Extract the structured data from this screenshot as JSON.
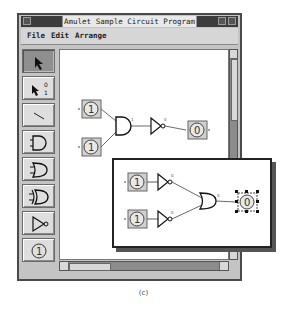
{
  "window": {
    "title": "Amulet Sample Circuit Program",
    "menu": [
      {
        "label": "File"
      },
      {
        "label": "Edit"
      },
      {
        "label": "Arrange"
      }
    ]
  },
  "palette": {
    "tools": [
      {
        "name": "select-tool",
        "selected": true
      },
      {
        "name": "toggle-value-tool",
        "label_top": "0",
        "label_bottom": "1",
        "selected": false
      },
      {
        "name": "wire-tool",
        "selected": false
      },
      {
        "name": "and-gate-tool",
        "selected": false
      },
      {
        "name": "or-gate-tool",
        "selected": false
      },
      {
        "name": "xor-gate-tool",
        "selected": false
      },
      {
        "name": "not-gate-tool",
        "selected": false
      },
      {
        "name": "input-switch-tool",
        "label": "1",
        "selected": false
      }
    ]
  },
  "canvas": {
    "inputs": [
      {
        "value": "1"
      },
      {
        "value": "1"
      }
    ],
    "gates": [
      "and",
      "not"
    ],
    "output": {
      "value": "0"
    },
    "gate_output_labels": {
      "and": "1",
      "not": "0"
    }
  },
  "inset": {
    "inputs": [
      {
        "value": "1"
      },
      {
        "value": "1"
      }
    ],
    "gates": [
      "not",
      "not",
      "or"
    ],
    "output": {
      "value": "0",
      "selected": true
    },
    "gate_output_labels": {
      "not1": "0",
      "not2": "0",
      "or": "0"
    }
  },
  "caption": "(c)"
}
